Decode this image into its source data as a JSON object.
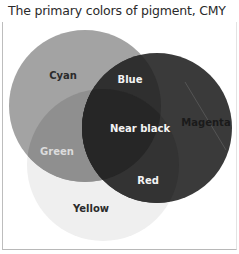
{
  "title": "The primary colors of pigment, CMY",
  "circles": {
    "cyan": {
      "label": "Cyan",
      "color": "#a3a3a3"
    },
    "magenta": {
      "label": "Magenta",
      "color": "#3a3a3a"
    },
    "yellow": {
      "label": "Yellow",
      "color": "#efefef"
    }
  },
  "overlaps": {
    "blue": {
      "label": "Blue",
      "color": "#2e2e2e"
    },
    "green": {
      "label": "Green",
      "color": "#8f8f8f"
    },
    "red": {
      "label": "Red",
      "color": "#333333"
    },
    "near_black": {
      "label": "Near black",
      "color": "#282828"
    }
  }
}
